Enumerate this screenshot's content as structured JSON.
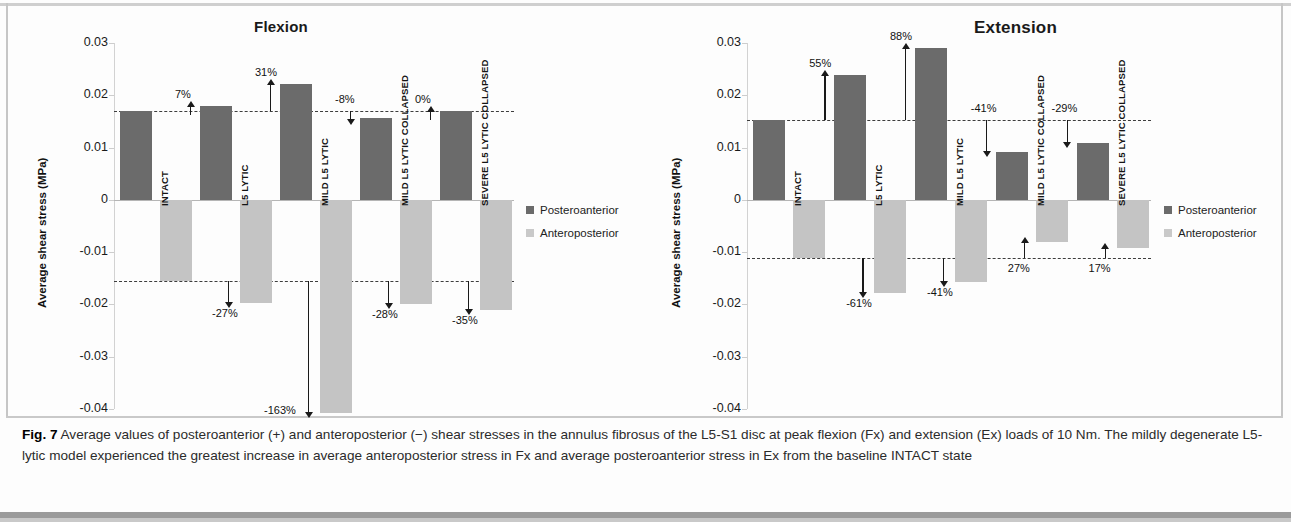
{
  "figure": {
    "caption_label": "Fig. 7",
    "caption_text": " Average values of posteroanterior (+) and anteroposterior (−) shear stresses in the annulus fibrosus of the L5-S1 disc at peak flexion (Fx) and extension (Ex) loads of 10 Nm. The mildly degenerate L5-lytic model experienced the greatest increase in average anteroposterior stress in Fx and average posteroanterior stress in Ex from the baseline INTACT state"
  },
  "legend": {
    "posteroanterior_label": "Posteroanterior",
    "anteroposterior_label": "Anteroposterior",
    "posteroanterior_color": "#6b6b6b",
    "anteroposterior_color": "#c4c4c4"
  },
  "chart_data": [
    {
      "type": "bar",
      "title": "Flexion",
      "xlabel": "",
      "ylabel": "Average shear stress (MPa)",
      "ylim": [
        -0.04,
        0.03
      ],
      "yticks": [
        "0.03",
        "0.02",
        "0.01",
        "0",
        "-0.01",
        "-0.02",
        "-0.03",
        "-0.04"
      ],
      "ytick_values": [
        0.03,
        0.02,
        0.01,
        0,
        -0.01,
        -0.02,
        -0.03,
        -0.04
      ],
      "grid": false,
      "legend_position": "right",
      "reference_lines": [
        0.017,
        -0.0155
      ],
      "categories": [
        "INTACT",
        "L5 LYTIC",
        "MILD L5 LYTIC",
        "MILD L5 LYTIC COLLAPSED",
        "SEVERE L5 LYTIC COLLAPSED"
      ],
      "series": [
        {
          "name": "Posteroanterior",
          "values": [
            0.017,
            0.018,
            0.0222,
            0.0156,
            0.017
          ]
        },
        {
          "name": "Anteroposterior",
          "values": [
            -0.0155,
            -0.0197,
            -0.0408,
            -0.0199,
            -0.021
          ]
        }
      ],
      "annotations_posteroanterior": [
        "",
        "7%",
        "31%",
        "-8%",
        "0%"
      ],
      "annotations_anteroposterior": [
        "",
        "-27%",
        "-163%",
        "-28%",
        "-35%"
      ]
    },
    {
      "type": "bar",
      "title": "Extension",
      "xlabel": "",
      "ylabel": "Average shear stress (MPa)",
      "ylim": [
        -0.04,
        0.03
      ],
      "yticks": [
        "0.03",
        "0.02",
        "0.01",
        "0",
        "-0.01",
        "-0.02",
        "-0.03",
        "-0.04"
      ],
      "ytick_values": [
        0.03,
        0.02,
        0.01,
        0,
        -0.01,
        -0.02,
        -0.03,
        -0.04
      ],
      "grid": false,
      "legend_position": "right",
      "reference_lines": [
        0.0153,
        -0.0111
      ],
      "categories": [
        "INTACT",
        "L5 LYTIC",
        "MILD L5 LYTIC",
        "MILD L5 LYTIC COLLAPSED",
        "SEVERE L5 LYTIC COLLAPSED"
      ],
      "series": [
        {
          "name": "Posteroanterior",
          "values": [
            0.0153,
            0.0238,
            0.029,
            0.0091,
            0.0108
          ]
        },
        {
          "name": "Anteroposterior",
          "values": [
            -0.0111,
            -0.0179,
            -0.0157,
            -0.0081,
            -0.0092
          ]
        }
      ],
      "annotations_posteroanterior": [
        "",
        "55%",
        "88%",
        "-41%",
        "-29%"
      ],
      "annotations_anteroposterior": [
        "",
        "-61%",
        "-41%",
        "27%",
        "17%"
      ]
    }
  ]
}
